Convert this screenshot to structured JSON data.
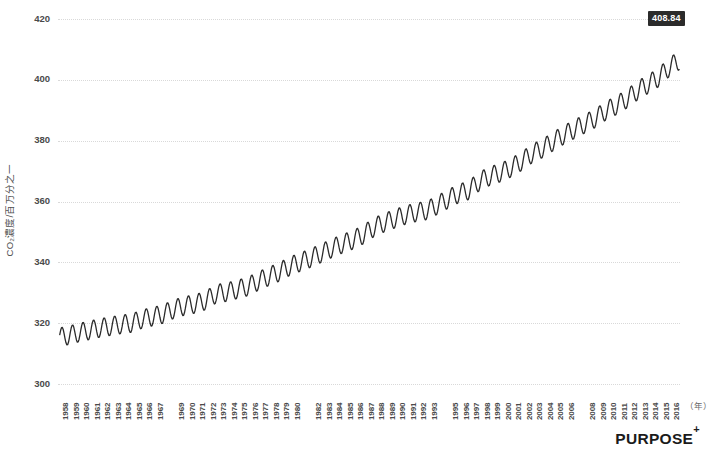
{
  "chart_data": {
    "type": "line",
    "title": "",
    "subtitle": "",
    "xlabel": "（年）",
    "ylabel": "CO₂濃度/百万分之一",
    "ylabel_main": "CO",
    "ylabel_sub": "2",
    "ylabel_rest": "濃度/百万分之一",
    "xlim": [
      1958,
      2017
    ],
    "ylim": [
      300,
      420
    ],
    "y_ticks": [
      300,
      320,
      340,
      360,
      380,
      400,
      420
    ],
    "grid": true,
    "legend": "none",
    "line_color": "#2b2b2b",
    "grid_color": "#d9d9d9",
    "annotation": {
      "label": "408.84",
      "background": "#2b2b2b",
      "text_color": "#ffffff"
    },
    "x_tick_labels": [
      "1958",
      "1959",
      "1960",
      "1961",
      "1962",
      "1963",
      "1964",
      "1965",
      "1966",
      "1967",
      "1969",
      "1970",
      "1971",
      "1972",
      "1973",
      "1974",
      "1975",
      "1976",
      "1977",
      "1978",
      "1979",
      "1980",
      "1982",
      "1983",
      "1984",
      "1985",
      "1986",
      "1987",
      "1988",
      "1989",
      "1990",
      "1991",
      "1992",
      "1993",
      "1995",
      "1996",
      "1997",
      "1998",
      "1999",
      "2000",
      "2001",
      "2002",
      "2003",
      "2004",
      "2005",
      "2006",
      "2008",
      "2009",
      "2010",
      "2011",
      "2012",
      "2013",
      "2014",
      "2015",
      "2016"
    ],
    "series": [
      {
        "name": "Atmospheric CO₂ concentration (Mauna Loa monthly mean)",
        "unit": "ppm",
        "x": [
          1958,
          1959,
          1960,
          1961,
          1962,
          1963,
          1964,
          1965,
          1966,
          1967,
          1968,
          1969,
          1970,
          1971,
          1972,
          1973,
          1974,
          1975,
          1976,
          1977,
          1978,
          1979,
          1980,
          1981,
          1982,
          1983,
          1984,
          1985,
          1986,
          1987,
          1988,
          1989,
          1990,
          1991,
          1992,
          1993,
          1994,
          1995,
          1996,
          1997,
          1998,
          1999,
          2000,
          2001,
          2002,
          2003,
          2004,
          2005,
          2006,
          2007,
          2008,
          2009,
          2010,
          2011,
          2012,
          2013,
          2014,
          2015,
          2016,
          2017
        ],
        "annual_mean": [
          315.3,
          315.98,
          316.91,
          317.64,
          318.45,
          318.99,
          319.62,
          320.04,
          321.38,
          322.16,
          323.04,
          324.62,
          325.68,
          326.32,
          327.45,
          329.68,
          330.18,
          331.11,
          332.04,
          333.83,
          335.4,
          336.84,
          338.75,
          340.11,
          341.45,
          343.05,
          344.65,
          346.12,
          347.42,
          349.19,
          351.57,
          353.12,
          354.39,
          355.61,
          356.45,
          357.1,
          358.83,
          360.82,
          362.61,
          363.73,
          366.7,
          368.38,
          369.55,
          371.14,
          373.28,
          375.8,
          377.52,
          379.8,
          381.9,
          383.79,
          385.6,
          387.43,
          389.9,
          391.65,
          393.85,
          396.52,
          398.65,
          400.83,
          404.21,
          406.55
        ],
        "seasonal_amplitude_ppm": 6.2,
        "seasonal_peak_month": 5,
        "seasonal_trough_month": 9,
        "last_value_label": "408.84"
      }
    ]
  },
  "branding": {
    "logo_text": "PURPOSE",
    "logo_superscript": "+"
  }
}
